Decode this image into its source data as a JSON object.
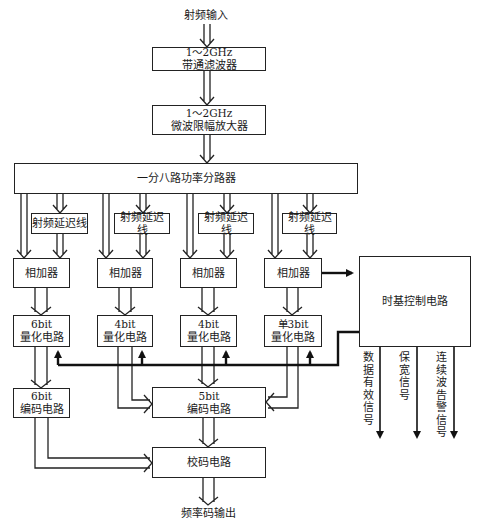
{
  "input_label": "射频输入",
  "output_label": "频率码输出",
  "blocks": {
    "bandpass": {
      "line1": "1～2GHz",
      "line2": "带通滤波器"
    },
    "amplifier": {
      "line1": "1～2GHz",
      "line2": "微波限幅放大器"
    },
    "splitter": {
      "label": "一分八路功率分路器"
    },
    "delay_lines": [
      {
        "label": "射频延迟线"
      },
      {
        "label": "射频延迟线"
      },
      {
        "label": "射频延迟线"
      },
      {
        "label": "射频延迟线"
      }
    ],
    "adders": [
      {
        "label": "相加器"
      },
      {
        "label": "相加器"
      },
      {
        "label": "相加器"
      },
      {
        "label": "相加器"
      }
    ],
    "quantizers": [
      {
        "line1": "6bit",
        "line2": "量化电路"
      },
      {
        "line1": "4bit",
        "line2": "量化电路"
      },
      {
        "line1": "4bit",
        "line2": "量化电路"
      },
      {
        "line1": "单3bit",
        "line2": "量化电路"
      }
    ],
    "encoder_6bit": {
      "line1": "6bit",
      "line2": "编码电路"
    },
    "encoder_5bit": {
      "line1": "5bit",
      "line2": "编码电路"
    },
    "check_code": {
      "label": "校码电路"
    },
    "timing_control": {
      "label": "时基控制电路"
    }
  },
  "signals": [
    {
      "label": "数据有效信号"
    },
    {
      "label": "保宽信号"
    },
    {
      "label": "连续波告警信号"
    }
  ],
  "colors": {
    "line": "#222222",
    "background": "#ffffff"
  }
}
